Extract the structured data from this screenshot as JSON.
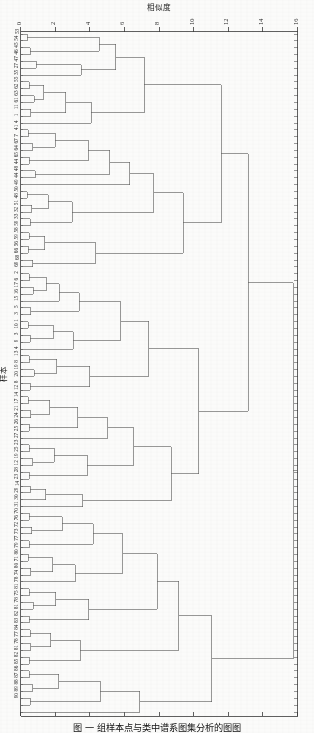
{
  "figure": {
    "title_top": "相似度",
    "ylabel": "样本",
    "caption": "图     一  组样本点与类中谱系图集分析的图图"
  },
  "axis": {
    "ticks": [
      0,
      2,
      4,
      6,
      8,
      10,
      12,
      14,
      16
    ],
    "tick_labels": [
      "0",
      "2",
      "4",
      "6",
      "8",
      "10",
      "12",
      "14",
      "16"
    ],
    "min": 0,
    "max": 16,
    "orientation": "top",
    "tick_label_rotation": -90
  },
  "style": {
    "line_color": "#5a5a5a",
    "axis_color": "#3a3a3a",
    "text_color": "#1f1f1f",
    "background": "#fbfbfa"
  },
  "chart_data": {
    "type": "dendrogram",
    "title": "相似度",
    "xlabel": "相似度",
    "ylabel": "样本",
    "xlim": [
      0,
      16
    ],
    "grid": false,
    "n_leaves": 100,
    "leaf_label_rotation": -90,
    "leaf_labels": [
      "53",
      "54",
      "45",
      "46",
      "47",
      "27",
      "35",
      "55",
      "62",
      "63",
      "61",
      "11",
      "1",
      "4",
      "41",
      "7",
      "67",
      "64",
      "65",
      "44",
      "48",
      "44",
      "49",
      "50",
      "48",
      "51",
      "32",
      "33",
      "59",
      "58",
      "59",
      "56",
      "66",
      "68",
      "69",
      "2",
      "6",
      "17",
      "16",
      "15",
      "5",
      "3",
      "1",
      "10",
      "3",
      "9",
      "4",
      "13",
      "8",
      "19",
      "20",
      "8",
      "12",
      "14",
      "17",
      "21",
      "24",
      "26",
      "25",
      "27",
      "23",
      "25",
      "19",
      "12",
      "28",
      "23",
      "14",
      "29",
      "30",
      "31",
      "70",
      "76",
      "72",
      "73",
      "77",
      "79",
      "80",
      "71",
      "80",
      "74",
      "78",
      "81",
      "75",
      "78",
      "81",
      "82",
      "83",
      "84",
      "77",
      "78",
      "81",
      "82",
      "85",
      "86",
      "87",
      "88",
      "89",
      "90"
    ],
    "merges": [
      {
        "height": 0.35,
        "note": "53-54 pair"
      },
      {
        "height": 0.55,
        "note": "45-46 pair"
      },
      {
        "height": 1.1,
        "note": "47-27 pair"
      },
      {
        "height": 3.1,
        "note": "upper subcluster A"
      },
      {
        "height": 5.9,
        "note": "upper subcluster B"
      },
      {
        "height": 7.2,
        "note": "upper cluster join"
      },
      {
        "height": 9.3,
        "note": "upper supercluster"
      },
      {
        "height": 11.6,
        "note": "upper block root"
      },
      {
        "height": 2.3,
        "note": "mid subcluster"
      },
      {
        "height": 4.8,
        "note": "mid subcluster"
      },
      {
        "height": 6.4,
        "note": "mid cluster join"
      },
      {
        "height": 8.6,
        "note": "mid supercluster"
      },
      {
        "height": 10.1,
        "note": "mid block root"
      },
      {
        "height": 13.1,
        "note": "upper+mid join"
      },
      {
        "height": 1.7,
        "note": "lower subcluster"
      },
      {
        "height": 3.6,
        "note": "lower subcluster"
      },
      {
        "height": 5.4,
        "note": "lower cluster join"
      },
      {
        "height": 8.0,
        "note": "lower supercluster"
      },
      {
        "height": 11.0,
        "note": "lower block root"
      },
      {
        "height": 15.8,
        "note": "global root"
      }
    ]
  }
}
